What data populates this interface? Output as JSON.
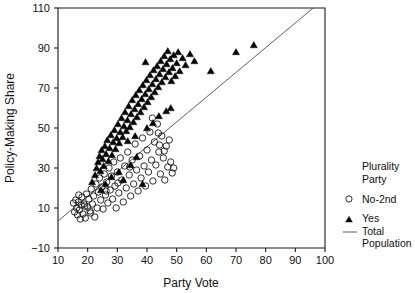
{
  "chart_data": {
    "type": "scatter",
    "title": "",
    "xlabel": "Party Vote",
    "ylabel": "Policy-Making Share",
    "xlim": [
      10,
      100
    ],
    "ylim": [
      -10,
      110
    ],
    "xticks": [
      10,
      20,
      30,
      40,
      50,
      60,
      70,
      80,
      90,
      100
    ],
    "yticks": [
      -10,
      10,
      30,
      50,
      70,
      90,
      110
    ],
    "grid": false,
    "legend_position": "right",
    "legend_title_line1": "Plurality",
    "legend_title_line2": "Party",
    "series": [
      {
        "name": "No-2nd",
        "marker": "open-circle",
        "points": [
          [
            15.2,
            12.5
          ],
          [
            15.6,
            8.0
          ],
          [
            16.0,
            14.0
          ],
          [
            16.3,
            10.0
          ],
          [
            16.6,
            6.5
          ],
          [
            16.9,
            13.0
          ],
          [
            17.2,
            9.0
          ],
          [
            17.5,
            4.5
          ],
          [
            17.8,
            11.5
          ],
          [
            18.1,
            15.5
          ],
          [
            18.4,
            7.0
          ],
          [
            18.8,
            12.0
          ],
          [
            19.2,
            5.0
          ],
          [
            19.6,
            17.0
          ],
          [
            20.0,
            10.5
          ],
          [
            20.4,
            14.5
          ],
          [
            20.8,
            8.5
          ],
          [
            21.2,
            19.5
          ],
          [
            21.6,
            12.0
          ],
          [
            22.0,
            16.0
          ],
          [
            22.4,
            5.5
          ],
          [
            22.8,
            22.0
          ],
          [
            23.2,
            10.0
          ],
          [
            23.6,
            18.0
          ],
          [
            24.0,
            25.0
          ],
          [
            24.4,
            14.0
          ],
          [
            24.8,
            20.5
          ],
          [
            25.2,
            9.5
          ],
          [
            25.6,
            27.0
          ],
          [
            26.0,
            16.5
          ],
          [
            26.4,
            23.0
          ],
          [
            26.8,
            12.5
          ],
          [
            27.2,
            30.0
          ],
          [
            27.6,
            19.0
          ],
          [
            28.0,
            26.0
          ],
          [
            28.4,
            14.5
          ],
          [
            28.8,
            33.0
          ],
          [
            29.2,
            21.0
          ],
          [
            29.6,
            10.0
          ],
          [
            30.0,
            28.0
          ],
          [
            30.5,
            17.5
          ],
          [
            31.0,
            35.0
          ],
          [
            31.5,
            24.0
          ],
          [
            32.0,
            13.0
          ],
          [
            32.5,
            31.0
          ],
          [
            33.0,
            20.0
          ],
          [
            33.5,
            38.0
          ],
          [
            34.0,
            26.5
          ],
          [
            34.5,
            16.0
          ],
          [
            35.0,
            34.0
          ],
          [
            35.5,
            22.0
          ],
          [
            36.0,
            42.0
          ],
          [
            36.5,
            29.0
          ],
          [
            37.0,
            18.5
          ],
          [
            37.5,
            36.0
          ],
          [
            38.0,
            25.0
          ],
          [
            38.5,
            45.0
          ],
          [
            39.0,
            31.0
          ],
          [
            39.5,
            21.0
          ],
          [
            40.0,
            39.0
          ],
          [
            40.5,
            28.0
          ],
          [
            41.0,
            48.0
          ],
          [
            41.5,
            34.0
          ],
          [
            42.0,
            23.5
          ],
          [
            42.5,
            43.0
          ],
          [
            43.0,
            31.5
          ],
          [
            43.5,
            52.0
          ],
          [
            44.0,
            38.0
          ],
          [
            44.5,
            27.0
          ],
          [
            45.0,
            46.0
          ],
          [
            45.5,
            35.0
          ],
          [
            46.0,
            24.0
          ],
          [
            46.5,
            41.0
          ],
          [
            47.0,
            30.5
          ],
          [
            47.5,
            44.0
          ],
          [
            48.0,
            33.0
          ],
          [
            48.5,
            27.5
          ],
          [
            49.0,
            30.0
          ],
          [
            43.8,
            47.5
          ],
          [
            41.8,
            55.0
          ],
          [
            44.2,
            41.5
          ],
          [
            45.8,
            38.5
          ],
          [
            34.2,
            30.5
          ],
          [
            30.2,
            22.5
          ],
          [
            26.2,
            18.5
          ],
          [
            19.0,
            11.0
          ],
          [
            17.0,
            16.5
          ],
          [
            21.0,
            7.5
          ]
        ]
      },
      {
        "name": "Yes",
        "marker": "filled-triangle",
        "points": [
          [
            23.0,
            30.0
          ],
          [
            23.5,
            33.0
          ],
          [
            24.0,
            36.0
          ],
          [
            24.3,
            28.5
          ],
          [
            24.7,
            39.0
          ],
          [
            25.0,
            34.5
          ],
          [
            25.4,
            31.0
          ],
          [
            25.8,
            41.0
          ],
          [
            26.2,
            37.0
          ],
          [
            26.6,
            44.0
          ],
          [
            27.0,
            33.5
          ],
          [
            27.4,
            40.0
          ],
          [
            27.8,
            46.5
          ],
          [
            28.2,
            36.5
          ],
          [
            28.6,
            43.0
          ],
          [
            29.0,
            49.0
          ],
          [
            29.4,
            39.5
          ],
          [
            29.8,
            45.0
          ],
          [
            30.2,
            52.0
          ],
          [
            30.6,
            42.5
          ],
          [
            31.0,
            48.0
          ],
          [
            31.4,
            55.0
          ],
          [
            31.8,
            45.5
          ],
          [
            32.2,
            51.0
          ],
          [
            32.6,
            58.0
          ],
          [
            33.0,
            48.5
          ],
          [
            33.4,
            54.0
          ],
          [
            33.8,
            61.0
          ],
          [
            34.2,
            50.5
          ],
          [
            34.6,
            57.0
          ],
          [
            35.0,
            64.0
          ],
          [
            35.4,
            53.0
          ],
          [
            35.8,
            59.5
          ],
          [
            36.2,
            66.5
          ],
          [
            36.6,
            55.5
          ],
          [
            37.0,
            62.0
          ],
          [
            37.4,
            69.0
          ],
          [
            37.8,
            58.0
          ],
          [
            38.2,
            64.5
          ],
          [
            38.6,
            71.5
          ],
          [
            39.0,
            60.5
          ],
          [
            39.4,
            67.0
          ],
          [
            39.8,
            74.0
          ],
          [
            40.2,
            63.0
          ],
          [
            40.6,
            69.5
          ],
          [
            41.0,
            76.5
          ],
          [
            41.4,
            65.5
          ],
          [
            41.8,
            72.0
          ],
          [
            42.2,
            79.0
          ],
          [
            42.6,
            68.0
          ],
          [
            43.0,
            74.5
          ],
          [
            43.4,
            81.0
          ],
          [
            43.8,
            70.5
          ],
          [
            44.2,
            77.0
          ],
          [
            44.6,
            83.5
          ],
          [
            45.0,
            73.0
          ],
          [
            45.4,
            79.5
          ],
          [
            45.8,
            86.0
          ],
          [
            46.2,
            75.5
          ],
          [
            46.6,
            82.0
          ],
          [
            47.0,
            88.5
          ],
          [
            47.4,
            78.0
          ],
          [
            47.8,
            84.5
          ],
          [
            48.2,
            73.5
          ],
          [
            48.6,
            80.0
          ],
          [
            49.0,
            86.5
          ],
          [
            49.5,
            76.0
          ],
          [
            50.0,
            82.5
          ],
          [
            50.5,
            88.0
          ],
          [
            39.5,
            83.0
          ],
          [
            51.0,
            78.5
          ],
          [
            52.0,
            85.0
          ],
          [
            53.0,
            81.5
          ],
          [
            54.5,
            87.0
          ],
          [
            56.0,
            83.5
          ],
          [
            30.5,
            28.0
          ],
          [
            32.0,
            24.0
          ],
          [
            34.5,
            31.5
          ],
          [
            36.5,
            35.5
          ],
          [
            38.5,
            22.0
          ],
          [
            28.0,
            25.5
          ],
          [
            26.0,
            22.0
          ],
          [
            24.5,
            19.0
          ],
          [
            22.5,
            26.5
          ],
          [
            21.5,
            23.0
          ],
          [
            61.5,
            78.5
          ],
          [
            70.0,
            88.0
          ],
          [
            76.0,
            91.5
          ],
          [
            44.0,
            56.0
          ],
          [
            46.5,
            58.5
          ],
          [
            48.0,
            60.0
          ],
          [
            40.0,
            50.0
          ],
          [
            42.0,
            52.5
          ],
          [
            36.0,
            46.0
          ],
          [
            33.5,
            43.5
          ]
        ]
      }
    ],
    "trendline": {
      "name": "Total Population",
      "x0": 10,
      "y0": 3.5,
      "x1": 96,
      "y1": 110
    }
  },
  "legend": {
    "title_line1": "Plurality",
    "title_line2": "Party",
    "entries": [
      {
        "label": "No-2nd",
        "marker": "open-circle-icon"
      },
      {
        "label": "Yes",
        "marker": "filled-triangle-icon"
      },
      {
        "label_line1": "Total",
        "label_line2": "Population",
        "marker": "line-icon"
      }
    ]
  }
}
